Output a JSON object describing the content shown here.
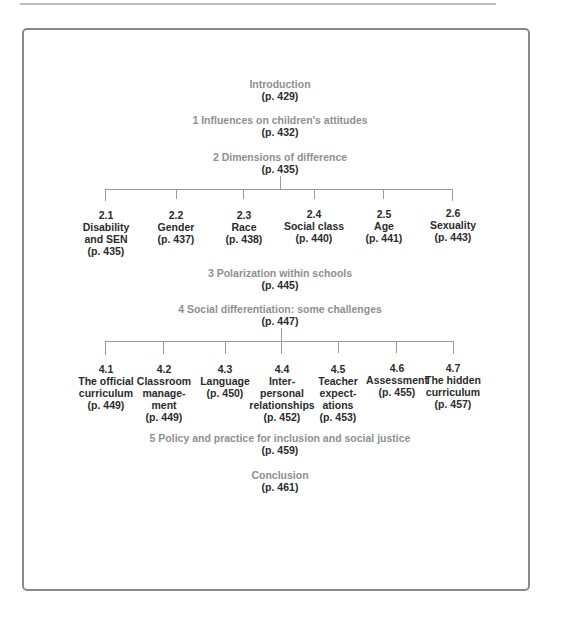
{
  "diagram": {
    "sections": [
      {
        "id": "intro",
        "label": "Introduction",
        "page": "(p. 429)"
      },
      {
        "id": "s1",
        "label": "1  Influences on children's attitudes",
        "page": "(p. 432)"
      },
      {
        "id": "s2",
        "label": "2  Dimensions of difference",
        "page": "(p. 435)",
        "children": [
          {
            "num": "2.1",
            "lines": [
              "Disability",
              "and SEN"
            ],
            "page": "(p. 435)"
          },
          {
            "num": "2.2",
            "lines": [
              "Gender"
            ],
            "page": "(p. 437)"
          },
          {
            "num": "2.3",
            "lines": [
              "Race"
            ],
            "page": "(p. 438)"
          },
          {
            "num": "2.4",
            "lines": [
              "Social class"
            ],
            "page": "(p. 440)"
          },
          {
            "num": "2.5",
            "lines": [
              "Age"
            ],
            "page": "(p. 441)"
          },
          {
            "num": "2.6",
            "lines": [
              "Sexuality"
            ],
            "page": "(p. 443)"
          }
        ]
      },
      {
        "id": "s3",
        "label": "3  Polarization within schools",
        "page": "(p. 445)"
      },
      {
        "id": "s4",
        "label": "4  Social differentiation: some challenges",
        "page": "(p. 447)",
        "children": [
          {
            "num": "4.1",
            "lines": [
              "The official",
              "curriculum"
            ],
            "page": "(p. 449)"
          },
          {
            "num": "4.2",
            "lines": [
              "Classroom",
              "manage-",
              "ment"
            ],
            "page": "(p. 449)"
          },
          {
            "num": "4.3",
            "lines": [
              "Language"
            ],
            "page": "(p. 450)"
          },
          {
            "num": "4.4",
            "lines": [
              "Inter-",
              "personal",
              "relationships"
            ],
            "page": "(p. 452)"
          },
          {
            "num": "4.5",
            "lines": [
              "Teacher",
              "expect-",
              "ations"
            ],
            "page": "(p. 453)"
          },
          {
            "num": "4.6",
            "lines": [
              "Assessment"
            ],
            "page": "(p. 455)"
          },
          {
            "num": "4.7",
            "lines": [
              "The hidden",
              "curriculum"
            ],
            "page": "(p. 457)"
          }
        ]
      },
      {
        "id": "s5",
        "label": "5  Policy and practice for inclusion and social justice",
        "page": "(p. 459)"
      },
      {
        "id": "conclusion",
        "label": "Conclusion",
        "page": "(p. 461)"
      }
    ]
  },
  "colors": {
    "heading": "#8f8f8f",
    "page": "#2b2b2b",
    "line": "#9a9a9a",
    "frame": "#8a8a8a"
  }
}
